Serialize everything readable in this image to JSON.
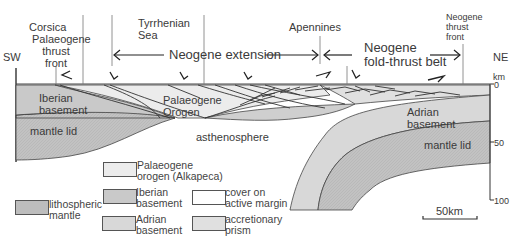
{
  "figure": {
    "type": "geological cross-section",
    "orientation": {
      "left": "SW",
      "right": "NE"
    },
    "top_labels": {
      "corsica": "Corsica",
      "palaeogene_thrust_front_1": "Palaeogene",
      "palaeogene_thrust_front_2": "thrust",
      "palaeogene_thrust_front_3": "front",
      "tyrrhenian_1": "Tyrrhenian",
      "tyrrhenian_2": "Sea",
      "apennines": "Apennines",
      "neogene_thrust_front_1": "Neogene",
      "neogene_thrust_front_2": "thrust",
      "neogene_thrust_front_3": "front"
    },
    "domains": {
      "extension": "Neogene extension",
      "fold_thrust_1": "Neogene",
      "fold_thrust_2": "fold-thrust belt"
    },
    "section_labels": {
      "iberian_1": "Iberian",
      "iberian_2": "basement",
      "mantle_lid_left": "mantle lid",
      "palaeogene_orogen_1": "Palaeogene",
      "palaeogene_orogen_2": "Orogen",
      "asthenosphere": "asthenosphere",
      "adrian_1": "Adrian",
      "adrian_2": "basement",
      "mantle_lid_right": "mantle lid"
    },
    "depth_scale": {
      "unit": "km",
      "ticks": [
        "0",
        "50",
        "100"
      ]
    },
    "scale_bar": "50km"
  },
  "legend": {
    "items": [
      {
        "label_1": "Palaeogene",
        "label_2": "orogen (Alkapeca)",
        "color": "#ececec"
      },
      {
        "label_1": "Iberian",
        "label_2": "basement",
        "color": "#c9c9c9"
      },
      {
        "label_1": "Adrian",
        "label_2": "basement",
        "color": "#d8d8d8"
      },
      {
        "label_1": "lithospheric",
        "label_2": "mantle",
        "color": "#bdbdbd"
      },
      {
        "label_1": "cover on",
        "label_2": "active margin",
        "color": "#ffffff"
      },
      {
        "label_1": "accretionary",
        "label_2": "prism",
        "color": "#e0e0e0"
      }
    ]
  }
}
